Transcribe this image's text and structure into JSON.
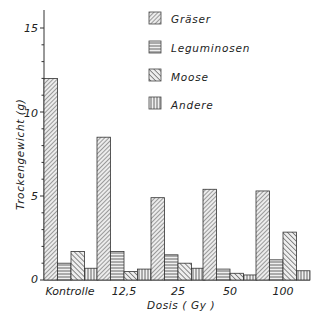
{
  "chart_data": {
    "type": "bar",
    "title": "",
    "xlabel": "Dosis ( Gy )",
    "ylabel": "Trockengewicht (g)",
    "ylim": [
      0,
      16
    ],
    "yticks": [
      0,
      5,
      10,
      15
    ],
    "grid": false,
    "legend_position": "top-right",
    "categories": [
      "Kontrolle",
      "12,5",
      "25",
      "50",
      "100"
    ],
    "series": [
      {
        "name": "Gräser",
        "pattern": "diagonal-fine",
        "values": [
          12.0,
          8.5,
          4.9,
          5.4,
          5.3
        ]
      },
      {
        "name": "Leguminosen",
        "pattern": "horizontal",
        "values": [
          1.0,
          1.7,
          1.5,
          0.65,
          1.2
        ]
      },
      {
        "name": "Moose",
        "pattern": "diagonal-coarse",
        "values": [
          1.7,
          0.5,
          1.0,
          0.4,
          2.85
        ]
      },
      {
        "name": "Andere",
        "pattern": "vertical",
        "values": [
          0.7,
          0.65,
          0.7,
          0.3,
          0.55
        ]
      }
    ]
  },
  "labels": {
    "ylabel": "Trockengewicht (g)",
    "xlabel": "Dosis ( Gy )",
    "y0": "0",
    "y5": "5",
    "y10": "10",
    "y15": "15",
    "cat0": "Kontrolle",
    "cat1": "12,5",
    "cat2": "25",
    "cat3": "50",
    "cat4": "100",
    "legend0": "Gräser",
    "legend1": "Leguminosen",
    "legend2": "Moose",
    "legend3": "Andere"
  }
}
